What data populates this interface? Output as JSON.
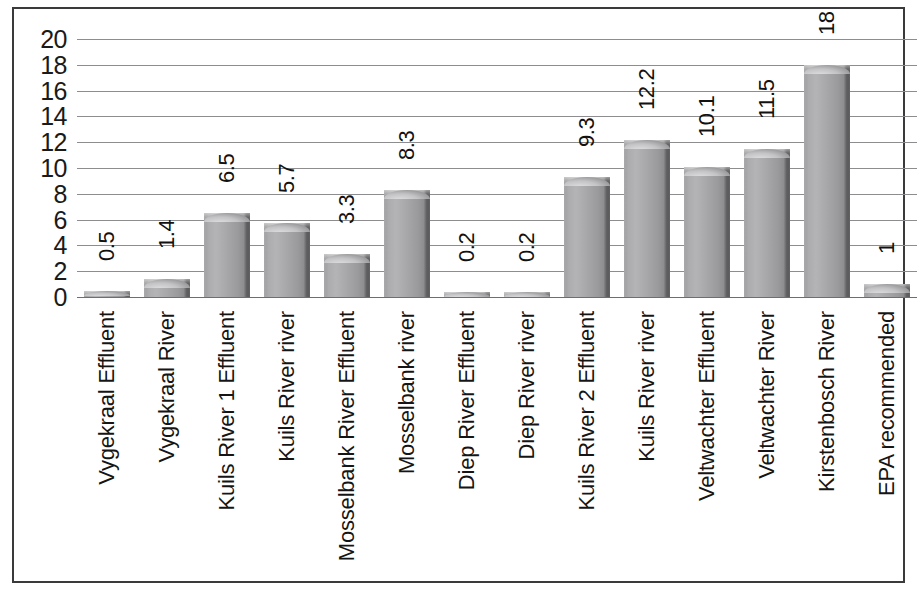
{
  "chart_data": {
    "type": "bar",
    "title": "",
    "subtitle": "",
    "xlabel": "",
    "ylabel": "",
    "ylim": [
      0,
      20
    ],
    "ytick_interval": 2,
    "yticks": [
      "20",
      "18",
      "16",
      "14",
      "12",
      "10",
      "8",
      "6",
      "4",
      "2",
      "0"
    ],
    "grid": "horizontal",
    "legend": "none",
    "categories": [
      "Vygekraal Effluent",
      "Vygekraal River",
      "Kuils River 1 Effluent",
      "Kuils River river",
      "Mosselbank River Effluent",
      "Mosselbank river",
      "Diep River Effluent",
      "Diep River river",
      "Kuils River 2 Effluent",
      "Kuils River river",
      "Veltwachter Effluent",
      "Veltwachter River",
      "Kirstenbosch River",
      "EPA recommended"
    ],
    "values": [
      0.5,
      1.4,
      6.5,
      5.7,
      3.3,
      8.3,
      0.2,
      0.2,
      9.3,
      12.2,
      10.1,
      11.5,
      18,
      1
    ],
    "value_labels": [
      "0.5",
      "1.4",
      "6.5",
      "5.7",
      "3.3",
      "8.3",
      "0.2",
      "0.2",
      "9.3",
      "12.2",
      "10.1",
      "11.5",
      "18",
      "1"
    ],
    "series": [
      {
        "name": "",
        "values": [
          0.5,
          1.4,
          6.5,
          5.7,
          3.3,
          8.3,
          0.2,
          0.2,
          9.3,
          12.2,
          10.1,
          11.5,
          18,
          1
        ]
      }
    ]
  },
  "style": {
    "bar_fill": "#a6a6a8",
    "bar_edge": "#4c4c4e",
    "bar_highlight": "#c3c3c5",
    "gridline_color": "#8d8d8f",
    "frame_color": "#3a3a3c",
    "text_color": "#151515",
    "background": "#ffffff"
  }
}
